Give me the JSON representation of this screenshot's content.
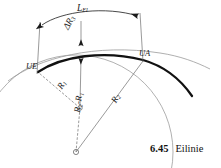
{
  "figure": {
    "caption_number": "6.45",
    "caption_text": "Eilinie",
    "labels": {
      "arc_length": "L",
      "arc_length_sub": "El",
      "delta_radius": "ΔR",
      "delta_radius_sub": "3",
      "entry_point": "UE",
      "exit_point": "UA",
      "radius_1": "R",
      "radius_1_sub": "1",
      "radius_2": "R",
      "radius_2_sub": "2",
      "radius_difference": "R₂-R₁"
    },
    "colors": {
      "bold_curve": "#111111",
      "thin_curve": "#8a8a8a",
      "construction_line": "#6e6e6e",
      "text": "#1a1a1a"
    },
    "geometry": {
      "center_r1": {
        "x": 80,
        "y": 108
      },
      "center_r2": {
        "x": 76,
        "y": 152
      },
      "point_ue": {
        "x": 38,
        "y": 72
      },
      "point_ua": {
        "x": 143,
        "y": 60
      },
      "radius_1_px": 55,
      "radius_2_px": 97
    }
  },
  "icons": {
    "center_marker": "small-circle-marker",
    "dimension_arrow": "arrowhead"
  }
}
